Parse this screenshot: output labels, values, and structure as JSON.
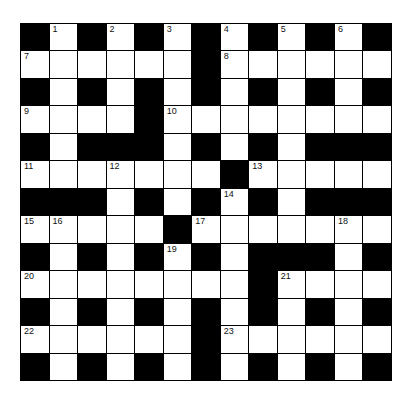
{
  "puzzle": {
    "type": "crossword",
    "size": 13,
    "colors": {
      "block": "#000000",
      "cell": "#ffffff",
      "number": "#111111"
    },
    "layout": [
      "#.#.#.#.#.#.#",
      "......#......",
      "#.#.#.#.#.#.#",
      "....#........",
      "#.###.#.#.###",
      ".......#.....",
      "###.#.#.#.###",
      ".....#.......",
      "#.#.#.#.###.#",
      "........#....",
      "#.#.#.#.#.#.#",
      "......#......",
      "#.#.#.#.#.#.#"
    ],
    "numbers": [
      {
        "row": 0,
        "col": 1,
        "n": "1"
      },
      {
        "row": 0,
        "col": 3,
        "n": "2"
      },
      {
        "row": 0,
        "col": 5,
        "n": "3"
      },
      {
        "row": 0,
        "col": 7,
        "n": "4"
      },
      {
        "row": 0,
        "col": 9,
        "n": "5"
      },
      {
        "row": 0,
        "col": 11,
        "n": "6"
      },
      {
        "row": 1,
        "col": 0,
        "n": "7"
      },
      {
        "row": 1,
        "col": 7,
        "n": "8"
      },
      {
        "row": 3,
        "col": 0,
        "n": "9"
      },
      {
        "row": 3,
        "col": 5,
        "n": "10"
      },
      {
        "row": 5,
        "col": 0,
        "n": "11"
      },
      {
        "row": 5,
        "col": 3,
        "n": "12"
      },
      {
        "row": 5,
        "col": 8,
        "n": "13"
      },
      {
        "row": 6,
        "col": 7,
        "n": "14"
      },
      {
        "row": 7,
        "col": 0,
        "n": "15"
      },
      {
        "row": 7,
        "col": 1,
        "n": "16"
      },
      {
        "row": 7,
        "col": 6,
        "n": "17"
      },
      {
        "row": 7,
        "col": 11,
        "n": "18"
      },
      {
        "row": 8,
        "col": 5,
        "n": "19"
      },
      {
        "row": 9,
        "col": 0,
        "n": "20"
      },
      {
        "row": 9,
        "col": 9,
        "n": "21"
      },
      {
        "row": 11,
        "col": 0,
        "n": "22"
      },
      {
        "row": 11,
        "col": 7,
        "n": "23"
      }
    ]
  }
}
